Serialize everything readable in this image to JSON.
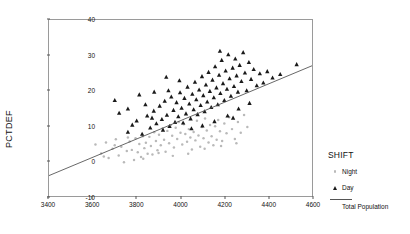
{
  "chart_data": {
    "type": "scatter",
    "title": "",
    "xlabel": "",
    "ylabel": "PCTDEF",
    "xlim": [
      3400,
      4600
    ],
    "ylim": [
      -10,
      40
    ],
    "xticks": [
      3400,
      3600,
      3800,
      4000,
      4200,
      4400,
      4600
    ],
    "yticks": [
      -10,
      0,
      10,
      20,
      30,
      40
    ],
    "grid": false,
    "frame": true,
    "legend": {
      "title": "SHIFT",
      "position": "right",
      "entries": [
        {
          "label": "Night",
          "marker": "dot",
          "color": "#b9b9b9"
        },
        {
          "label": "Day",
          "marker": "triangle",
          "color": "#1a1a1a"
        },
        {
          "label": "Total Population",
          "marker": "line",
          "color": "#555555"
        }
      ]
    },
    "fit_line": {
      "name": "Total Population",
      "color": "#555555",
      "x": [
        3400,
        4600
      ],
      "y": [
        -4.2,
        27.0
      ]
    },
    "series": [
      {
        "name": "Night",
        "marker": "dot",
        "color": "#b9b9b9",
        "points": [
          [
            3612,
            4.6
          ],
          [
            3638,
            2.1
          ],
          [
            3660,
            5.2
          ],
          [
            3672,
            0.8
          ],
          [
            3690,
            3.4
          ],
          [
            3705,
            6.1
          ],
          [
            3718,
            1.5
          ],
          [
            3730,
            4.0
          ],
          [
            3742,
            -0.4
          ],
          [
            3755,
            2.8
          ],
          [
            3768,
            5.5
          ],
          [
            3778,
            3.1
          ],
          [
            3788,
            0.2
          ],
          [
            3795,
            6.4
          ],
          [
            3805,
            2.4
          ],
          [
            3812,
            4.8
          ],
          [
            3820,
            1.1
          ],
          [
            3828,
            7.0
          ],
          [
            3835,
            3.6
          ],
          [
            3842,
            5.1
          ],
          [
            3850,
            2.0
          ],
          [
            3858,
            6.8
          ],
          [
            3865,
            4.2
          ],
          [
            3872,
            1.8
          ],
          [
            3880,
            8.1
          ],
          [
            3888,
            5.6
          ],
          [
            3895,
            3.0
          ],
          [
            3902,
            7.4
          ],
          [
            3910,
            4.4
          ],
          [
            3918,
            9.2
          ],
          [
            3925,
            6.0
          ],
          [
            3932,
            2.6
          ],
          [
            3940,
            8.5
          ],
          [
            3948,
            5.0
          ],
          [
            3955,
            10.1
          ],
          [
            3962,
            7.1
          ],
          [
            3970,
            3.8
          ],
          [
            3978,
            9.4
          ],
          [
            3985,
            6.2
          ],
          [
            3992,
            11.0
          ],
          [
            4000,
            8.0
          ],
          [
            4008,
            4.6
          ],
          [
            4015,
            10.4
          ],
          [
            4022,
            7.6
          ],
          [
            4030,
            5.4
          ],
          [
            4038,
            9.0
          ],
          [
            4045,
            6.6
          ],
          [
            4052,
            3.2
          ],
          [
            4060,
            8.2
          ],
          [
            4068,
            5.8
          ],
          [
            4075,
            11.4
          ],
          [
            4082,
            7.2
          ],
          [
            4090,
            4.0
          ],
          [
            4098,
            9.6
          ],
          [
            4105,
            6.4
          ],
          [
            4112,
            12.0
          ],
          [
            4120,
            8.6
          ],
          [
            4128,
            5.2
          ],
          [
            4135,
            10.2
          ],
          [
            4142,
            7.0
          ],
          [
            4150,
            4.4
          ],
          [
            4158,
            9.8
          ],
          [
            4165,
            6.0
          ],
          [
            4172,
            11.6
          ],
          [
            4180,
            8.4
          ],
          [
            4190,
            5.6
          ],
          [
            4200,
            10.6
          ],
          [
            4210,
            7.8
          ],
          [
            4222,
            12.4
          ],
          [
            4235,
            9.0
          ],
          [
            4248,
            6.2
          ],
          [
            4262,
            11.0
          ],
          [
            4275,
            8.0
          ],
          [
            4290,
            13.0
          ],
          [
            4305,
            9.6
          ],
          [
            3650,
            1.2
          ],
          [
            3700,
            4.4
          ],
          [
            3760,
            6.6
          ],
          [
            3830,
            0.6
          ],
          [
            3900,
            2.2
          ],
          [
            3965,
            1.4
          ],
          [
            4035,
            2.0
          ],
          [
            4110,
            3.4
          ],
          [
            4185,
            4.2
          ],
          [
            4255,
            5.0
          ]
        ]
      },
      {
        "name": "Day",
        "marker": "triangle",
        "color": "#1a1a1a",
        "points": [
          [
            3760,
            8.2
          ],
          [
            3800,
            11.4
          ],
          [
            3825,
            7.6
          ],
          [
            3848,
            12.8
          ],
          [
            3862,
            9.4
          ],
          [
            3878,
            14.2
          ],
          [
            3890,
            10.6
          ],
          [
            3905,
            15.6
          ],
          [
            3915,
            11.8
          ],
          [
            3928,
            17.0
          ],
          [
            3938,
            13.0
          ],
          [
            3950,
            9.8
          ],
          [
            3958,
            18.2
          ],
          [
            3968,
            14.4
          ],
          [
            3975,
            11.0
          ],
          [
            3982,
            16.6
          ],
          [
            3990,
            12.6
          ],
          [
            3998,
            19.4
          ],
          [
            4005,
            15.0
          ],
          [
            4012,
            10.8
          ],
          [
            4018,
            17.8
          ],
          [
            4025,
            13.4
          ],
          [
            4032,
            21.0
          ],
          [
            4040,
            16.2
          ],
          [
            4046,
            12.0
          ],
          [
            4054,
            19.0
          ],
          [
            4060,
            14.6
          ],
          [
            4066,
            22.4
          ],
          [
            4072,
            17.4
          ],
          [
            4078,
            13.2
          ],
          [
            4085,
            20.2
          ],
          [
            4092,
            15.8
          ],
          [
            4098,
            24.0
          ],
          [
            4104,
            18.6
          ],
          [
            4110,
            14.0
          ],
          [
            4116,
            21.6
          ],
          [
            4122,
            16.8
          ],
          [
            4128,
            25.2
          ],
          [
            4134,
            19.8
          ],
          [
            4140,
            15.2
          ],
          [
            4146,
            23.0
          ],
          [
            4152,
            18.0
          ],
          [
            4158,
            26.8
          ],
          [
            4164,
            20.8
          ],
          [
            4170,
            16.0
          ],
          [
            4176,
            24.4
          ],
          [
            4182,
            19.2
          ],
          [
            4188,
            28.6
          ],
          [
            4194,
            22.0
          ],
          [
            4200,
            17.2
          ],
          [
            4206,
            25.6
          ],
          [
            4212,
            20.4
          ],
          [
            4218,
            30.2
          ],
          [
            4224,
            23.4
          ],
          [
            4230,
            18.4
          ],
          [
            4238,
            26.4
          ],
          [
            4244,
            21.2
          ],
          [
            4250,
            29.0
          ],
          [
            4256,
            24.2
          ],
          [
            4262,
            19.6
          ],
          [
            4270,
            27.2
          ],
          [
            4278,
            22.6
          ],
          [
            4286,
            30.8
          ],
          [
            4294,
            25.0
          ],
          [
            4302,
            20.0
          ],
          [
            4312,
            28.0
          ],
          [
            4322,
            23.2
          ],
          [
            4334,
            26.0
          ],
          [
            4348,
            21.4
          ],
          [
            4362,
            24.8
          ],
          [
            4378,
            22.2
          ],
          [
            4396,
            25.4
          ],
          [
            4420,
            23.6
          ],
          [
            4455,
            24.6
          ],
          [
            4530,
            27.4
          ],
          [
            3720,
            13.6
          ],
          [
            3780,
            10.2
          ],
          [
            3840,
            16.0
          ],
          [
            3870,
            12.2
          ],
          [
            3920,
            8.8
          ],
          [
            3945,
            20.0
          ],
          [
            3995,
            22.8
          ],
          [
            4050,
            9.2
          ],
          [
            4100,
            10.0
          ],
          [
            4155,
            11.2
          ],
          [
            4215,
            12.8
          ],
          [
            4265,
            14.8
          ],
          [
            4315,
            16.4
          ],
          [
            4180,
            31.2
          ],
          [
            4240,
            12.2
          ],
          [
            3700,
            17.2
          ],
          [
            3760,
            14.8
          ],
          [
            3812,
            18.8
          ],
          [
            3880,
            19.6
          ],
          [
            3935,
            23.8
          ]
        ]
      }
    ]
  }
}
